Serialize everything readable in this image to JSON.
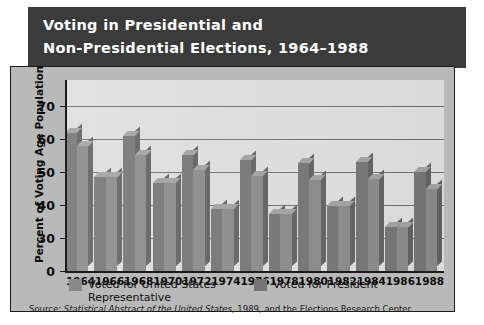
{
  "title": {
    "line1": "Voting in Presidential and",
    "line2": "Non-Presidential Elections, 1964–1988"
  },
  "axes": {
    "ylabel": "Percent of Voting Age Population",
    "yticks": [
      "70",
      "60",
      "50",
      "40",
      "30",
      "0"
    ],
    "ytick_values": [
      70,
      60,
      50,
      40,
      30,
      0
    ]
  },
  "legend": {
    "entry1": "Voted for United States Representative",
    "entry2": "Voted for President"
  },
  "source": {
    "prefix": "Source: ",
    "italic": "Statistical Abstract of the United States,",
    "suffix": " 1989, and the Elections Research Center"
  },
  "colors": {
    "banner": "#3b3b3b",
    "frame": "#b9b9b9",
    "plot": "#dedede",
    "bar_representative": "#8a8a8a",
    "bar_president": "#757575",
    "bar_top": "#a2a2a2",
    "bar_side": "#616161",
    "gridline": "#6f6f6f",
    "axis": "#1b1b1b"
  },
  "chart_data": {
    "type": "bar",
    "title": "Voting in Presidential and Non-Presidential Elections, 1964–1988",
    "xlabel": "",
    "ylabel": "Percent of Voting Age Population",
    "categories": [
      "1964",
      "1966",
      "1968",
      "1970",
      "1972",
      "1974",
      "1976",
      "1978",
      "1980",
      "1982",
      "1984",
      "1986",
      "1988"
    ],
    "ylim": [
      30,
      72
    ],
    "yticks": [
      30,
      40,
      50,
      60,
      70
    ],
    "y_axis_broken_at": 30,
    "grid": true,
    "legend_position": "below-axes",
    "series": [
      {
        "name": "Voted for United States Representative",
        "values": [
          57.8,
          48.4,
          55.1,
          46.6,
          50.7,
          38.9,
          48.9,
          37.2,
          47.6,
          39.8,
          47.8,
          33.4,
          44.7
        ]
      },
      {
        "name": "Voted for President",
        "values": [
          61.9,
          48.4,
          60.9,
          46.6,
          55.2,
          38.9,
          53.5,
          37.2,
          52.6,
          39.8,
          53.1,
          33.4,
          50.1
        ]
      }
    ]
  }
}
